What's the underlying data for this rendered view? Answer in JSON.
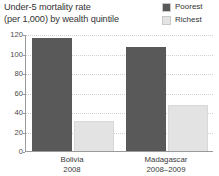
{
  "title": {
    "line1": "Under-5 mortality rate",
    "line2": "(per 1,000) by wealth quintile"
  },
  "legend": {
    "position": "top-right",
    "items": [
      {
        "label": "Poorest",
        "color": "#595959"
      },
      {
        "label": "Richest",
        "color": "#e3e3e3"
      }
    ]
  },
  "axis": {
    "y_ticks": [
      "120",
      "100",
      "80",
      "60",
      "40",
      "20",
      "0"
    ],
    "x_groups": [
      {
        "name": "Bolivia",
        "period": "2008"
      },
      {
        "name": "Madagascar",
        "period": "2008–2009"
      }
    ]
  },
  "chart_data": {
    "type": "bar",
    "title": "Under-5 mortality rate (per 1,000) by wealth quintile",
    "xlabel": "",
    "ylabel": "",
    "ylim": [
      0,
      120
    ],
    "yticks": [
      0,
      20,
      40,
      60,
      80,
      100,
      120
    ],
    "grid": true,
    "legend_position": "top-right",
    "categories": [
      "Bolivia 2008",
      "Madagascar 2008–2009"
    ],
    "series": [
      {
        "name": "Poorest",
        "color": "#595959",
        "values": [
          116,
          107
        ]
      },
      {
        "name": "Richest",
        "color": "#e3e3e3",
        "values": [
          31,
          47
        ]
      }
    ]
  }
}
